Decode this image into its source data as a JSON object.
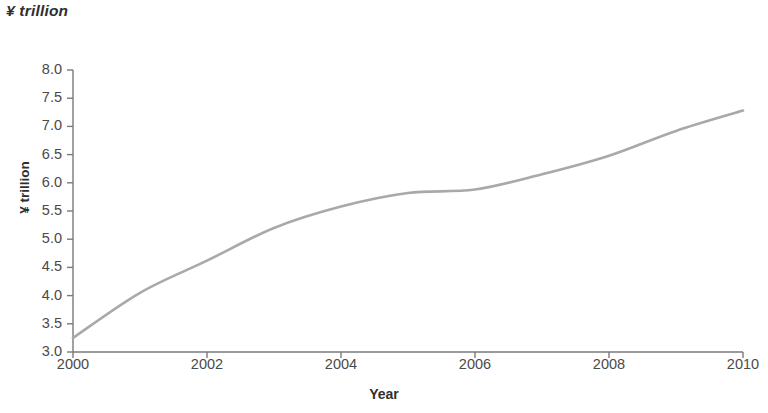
{
  "chart_data": {
    "type": "line",
    "title": "",
    "unit_note": "¥ trillion",
    "xlabel": "Year",
    "ylabel": "¥ trillion",
    "x": [
      2000,
      2001,
      2002,
      2003,
      2004,
      2005,
      2006,
      2007,
      2008,
      2009,
      2010
    ],
    "values": [
      3.25,
      4.05,
      4.62,
      5.2,
      5.58,
      5.82,
      5.88,
      6.15,
      6.48,
      6.92,
      7.28
    ],
    "series": [
      {
        "name": "¥ trillion",
        "values": [
          3.25,
          4.05,
          4.62,
          5.2,
          5.58,
          5.82,
          5.88,
          6.15,
          6.48,
          6.92,
          7.28
        ]
      }
    ],
    "xlim": [
      2000,
      2010
    ],
    "ylim": [
      3.0,
      8.0
    ],
    "y_ticks": [
      "3.0",
      "3.5",
      "4.0",
      "4.5",
      "5.0",
      "5.5",
      "6.0",
      "6.5",
      "7.0",
      "7.5",
      "8.0"
    ],
    "y_tick_values": [
      3.0,
      3.5,
      4.0,
      4.5,
      5.0,
      5.5,
      6.0,
      6.5,
      7.0,
      7.5,
      8.0
    ],
    "x_ticks": [
      "2000",
      "2002",
      "2004",
      "2006",
      "2008",
      "2010"
    ],
    "x_tick_values": [
      2000,
      2002,
      2004,
      2006,
      2008,
      2010
    ],
    "grid": false,
    "legend": "none",
    "line_color": "#a9a9a9",
    "axis_color": "#7a7a7a",
    "text_color": "#3a3a3a"
  }
}
